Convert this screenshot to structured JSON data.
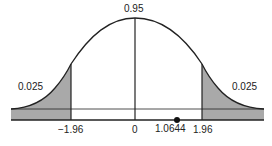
{
  "diagram": {
    "center_label": "0.95",
    "left_tail_label": "0.025",
    "right_tail_label": "0.025",
    "x_ticks": [
      "−1.96",
      "0",
      "1.0644",
      "1.96"
    ],
    "test_statistic": "1.0644",
    "colors": {
      "shade": "#a9a9a9",
      "line": "#222222"
    }
  }
}
